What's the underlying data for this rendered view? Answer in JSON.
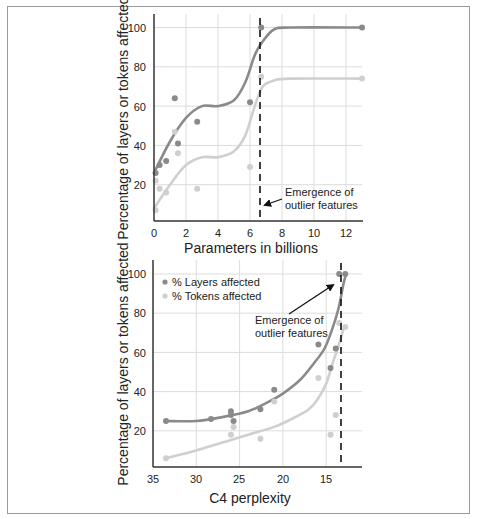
{
  "colors": {
    "layers": "#8a8a8a",
    "tokens": "#cfcfcf",
    "grid": "#dcdcdc",
    "axis": "#333333",
    "frame": "#9a9a9a"
  },
  "chart_data": [
    {
      "type": "scatter",
      "title": "",
      "xlabel": "Parameters in billions",
      "ylabel": "Percentage of layers or tokens affected",
      "xlim": [
        0,
        13
      ],
      "ylim": [
        0,
        105
      ],
      "xticks": [
        "0",
        "2",
        "4",
        "6",
        "8",
        "10",
        "12"
      ],
      "yticks": [
        "20",
        "40",
        "60",
        "80",
        "100"
      ],
      "grid": true,
      "legend": null,
      "series": [
        {
          "name": "% Layers affected",
          "points": [
            [
              0.1,
              26
            ],
            [
              0.35,
              30
            ],
            [
              0.76,
              32
            ],
            [
              1.3,
              64
            ],
            [
              1.5,
              41
            ],
            [
              2.7,
              52
            ],
            [
              6.0,
              62
            ],
            [
              6.7,
              100
            ],
            [
              13,
              100
            ]
          ],
          "fit_curve": [
            [
              0,
              26
            ],
            [
              1,
              42
            ],
            [
              2,
              54
            ],
            [
              3,
              60
            ],
            [
              4,
              60
            ],
            [
              5,
              63
            ],
            [
              5.7,
              72
            ],
            [
              6.3,
              86
            ],
            [
              6.8,
              93
            ],
            [
              7.5,
              99
            ],
            [
              8.5,
              100
            ],
            [
              13,
              100
            ]
          ]
        },
        {
          "name": "% Tokens affected",
          "points": [
            [
              0.1,
              7
            ],
            [
              0.1,
              22
            ],
            [
              0.35,
              18
            ],
            [
              0.76,
              16
            ],
            [
              1.3,
              47
            ],
            [
              1.5,
              36
            ],
            [
              2.7,
              18
            ],
            [
              6.0,
              29
            ],
            [
              6.7,
              75
            ],
            [
              13,
              74
            ]
          ],
          "fit_curve": [
            [
              0,
              8
            ],
            [
              1,
              20
            ],
            [
              2,
              30
            ],
            [
              3,
              34
            ],
            [
              4,
              34
            ],
            [
              5,
              37
            ],
            [
              5.7,
              45
            ],
            [
              6.3,
              60
            ],
            [
              6.8,
              70
            ],
            [
              7.5,
              73
            ],
            [
              8.5,
              74
            ],
            [
              13,
              74
            ]
          ]
        }
      ],
      "annotation": {
        "text_lines": [
          "Emergence of",
          "outlier features"
        ],
        "vline_x": 6.7
      }
    },
    {
      "type": "scatter",
      "title": "",
      "xlabel": "C4 perplexity",
      "ylabel": "Percentage of layers or tokens affected",
      "xlim": [
        35,
        12
      ],
      "ylim": [
        0,
        105
      ],
      "xticks": [
        "35",
        "30",
        "25",
        "20",
        "15"
      ],
      "yticks": [
        "20",
        "40",
        "60",
        "80",
        "100"
      ],
      "grid": true,
      "legend": {
        "position": "upper left",
        "entries": [
          "% Layers affected",
          "% Tokens affected"
        ]
      },
      "series": [
        {
          "name": "% Layers affected",
          "points": [
            [
              33.5,
              25
            ],
            [
              28.3,
              26
            ],
            [
              26.0,
              30
            ],
            [
              26.0,
              28
            ],
            [
              25.7,
              25
            ],
            [
              22.6,
              31
            ],
            [
              21.0,
              41
            ],
            [
              15.9,
              64
            ],
            [
              14.5,
              52
            ],
            [
              13.9,
              62
            ],
            [
              13.5,
              100
            ],
            [
              12.8,
              100
            ]
          ],
          "fit_curve": [
            [
              33.5,
              25
            ],
            [
              30,
              25
            ],
            [
              27,
              27
            ],
            [
              24,
              30
            ],
            [
              22,
              34
            ],
            [
              20,
              39
            ],
            [
              18,
              46
            ],
            [
              16.5,
              54
            ],
            [
              15.2,
              62
            ],
            [
              14.3,
              72
            ],
            [
              13.6,
              82
            ],
            [
              13.0,
              95
            ],
            [
              12.7,
              100
            ]
          ]
        },
        {
          "name": "% Tokens affected",
          "points": [
            [
              33.5,
              6
            ],
            [
              26.0,
              18
            ],
            [
              25.7,
              22
            ],
            [
              22.6,
              16
            ],
            [
              21.0,
              35
            ],
            [
              15.9,
              47
            ],
            [
              14.5,
              18
            ],
            [
              13.9,
              28
            ],
            [
              13.5,
              75
            ],
            [
              12.8,
              73
            ]
          ],
          "fit_curve": [
            [
              33.5,
              6
            ],
            [
              30,
              10
            ],
            [
              27,
              14
            ],
            [
              24,
              18
            ],
            [
              21,
              22
            ],
            [
              19,
              26
            ],
            [
              17,
              31
            ],
            [
              16,
              36
            ],
            [
              15,
              44
            ],
            [
              14.3,
              54
            ],
            [
              13.6,
              63
            ],
            [
              13.0,
              72
            ]
          ]
        }
      ],
      "annotation": {
        "text_lines": [
          "Emergence of",
          "outlier features"
        ],
        "vline_x": 13.3
      }
    }
  ],
  "top_chart": {
    "ylabel": "Percentage of layers or tokens affected",
    "xlabel": "Parameters in billions",
    "yticks": [
      "20",
      "40",
      "60",
      "80",
      "100"
    ],
    "xticks": [
      "0",
      "2",
      "4",
      "6",
      "8",
      "10",
      "12"
    ],
    "annotation_line1": "Emergence of",
    "annotation_line2": "outlier features"
  },
  "bottom_chart": {
    "ylabel": "Percentage of layers or tokens affected",
    "xlabel": "C4 perplexity",
    "yticks": [
      "20",
      "40",
      "60",
      "80",
      "100"
    ],
    "xticks": [
      "35",
      "30",
      "25",
      "20",
      "15"
    ],
    "legend_layers": "% Layers affected",
    "legend_tokens": "% Tokens affected",
    "annotation_line1": "Emergence of",
    "annotation_line2": "outlier features"
  }
}
